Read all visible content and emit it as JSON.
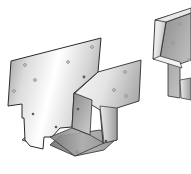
{
  "image": {
    "description": "Product illustration of galvanized steel post-to-beam bracket hardware",
    "background_color": "#ffffff",
    "items": [
      {
        "name": "main-bracket",
        "label": "Post base / beam bracket (front view)",
        "visible": "full"
      },
      {
        "name": "secondary-bracket",
        "label": "Second bracket (partially cropped at right edge)",
        "visible": "partial"
      }
    ],
    "colors": {
      "metal_light": "#f4f4f4",
      "metal_mid": "#c8c8c8",
      "metal_dark": "#8a8a8a",
      "edge": "#2b2b2b",
      "hole": "#6a6a6a"
    }
  }
}
